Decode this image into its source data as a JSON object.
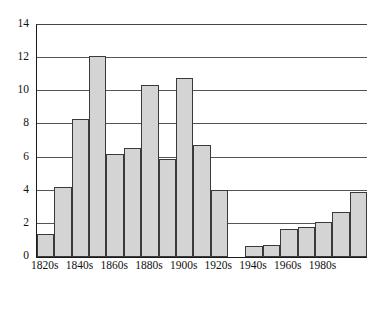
{
  "chart_data": {
    "type": "bar",
    "title": "",
    "subtitle": "",
    "xlabel": "",
    "ylabel": "",
    "categories": [
      "1820s",
      "1830s",
      "1840s",
      "1850s",
      "1860s",
      "1870s",
      "1880s",
      "1890s",
      "1900s",
      "1910s",
      "1920s",
      "1930s",
      "1940s",
      "1950s",
      "1960s",
      "1970s",
      "1980s",
      "1990s",
      "2000s"
    ],
    "values": [
      1.4,
      4.2,
      8.3,
      12.15,
      6.2,
      6.6,
      10.4,
      5.9,
      10.8,
      6.75,
      4.05,
      0,
      0.65,
      0.7,
      1.7,
      1.8,
      2.1,
      2.7,
      3.9
    ],
    "ylim": [
      0,
      14
    ],
    "yticks": [
      0,
      2,
      4,
      6,
      8,
      10,
      12,
      14
    ],
    "ytick_labels": [
      "0",
      "2",
      "4",
      "6",
      "8",
      "10",
      "12",
      "14"
    ],
    "xtick_labels": [
      "1820s",
      "1840s",
      "1860s",
      "1880s",
      "1900s",
      "1920s",
      "1940s",
      "1960s",
      "1980s"
    ],
    "xtick_indices": [
      0,
      2,
      4,
      6,
      8,
      10,
      12,
      14,
      16
    ],
    "grid": true,
    "grid_axis": "y",
    "legend": false,
    "legend_position": "none",
    "bar_fill_color": "#d4d4d4",
    "bar_edge_color": "#3a3a3a",
    "axis_color": "#1a1a1a",
    "grid_color": "#555555",
    "background_color": "#ffffff"
  }
}
